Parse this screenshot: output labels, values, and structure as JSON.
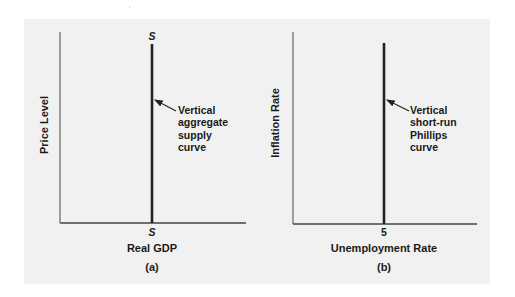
{
  "figure": {
    "panels": [
      {
        "id": "a",
        "caption": "(a)",
        "y_axis_label": "Price Level",
        "x_axis_label": "Real GDP",
        "curve_top_label": "S",
        "curve_bottom_tick": "S",
        "annotation": [
          "Vertical",
          "aggregate",
          "supply",
          "curve"
        ]
      },
      {
        "id": "b",
        "caption": "(b)",
        "y_axis_label": "Inflation Rate",
        "x_axis_label": "Unemployment Rate",
        "curve_bottom_tick": "5",
        "annotation": [
          "Vertical",
          "short-run",
          "Phillips",
          "curve"
        ]
      }
    ],
    "colors": {
      "background": "#f1f1f1",
      "axis": "#555555",
      "curve": "#222222",
      "text": "#1a1a1a"
    }
  }
}
